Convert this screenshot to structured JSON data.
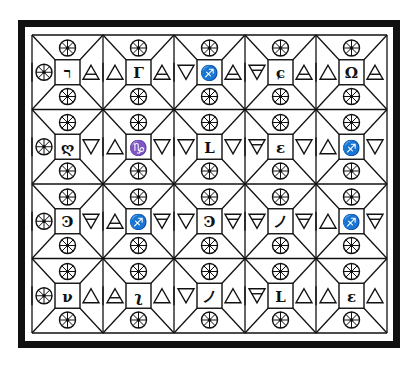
{
  "diagram": {
    "title": "",
    "colors": {
      "ink": "#111111",
      "paper": "#ffffff"
    },
    "frame": {
      "outer": {
        "x": 21.5,
        "y": 23.5,
        "w": 375,
        "h": 321
      }
    },
    "grid": {
      "x0": 32,
      "y0": 35,
      "cell_w": 71,
      "cell_h": 74.5,
      "cols": 5,
      "rows": 4,
      "box_w": 25,
      "box_h": 25
    },
    "legend": {
      "wheel": "eight-spoked wheel",
      "up": "fire triangle",
      "up_line": "air triangle",
      "down": "water triangle",
      "down_line": "earth triangle"
    },
    "rows": [
      [
        {
          "left": "wheel",
          "center": "ר",
          "right": "up_line"
        },
        {
          "left": "up",
          "center": "Γ",
          "right": "up_line"
        },
        {
          "left": "down",
          "center": "♐",
          "right": "up_line"
        },
        {
          "left": "down_line",
          "center": "ɕ",
          "right": "up_line"
        },
        {
          "left": "up",
          "center": "Ω",
          "right": "up_line"
        }
      ],
      [
        {
          "left": "wheel",
          "center": "ღ",
          "right": "down"
        },
        {
          "left": "up",
          "center": "♑",
          "right": "down"
        },
        {
          "left": "down",
          "center": "L",
          "right": "down"
        },
        {
          "left": "down_line",
          "center": "ε",
          "right": "down"
        },
        {
          "left": "up",
          "center": "♐",
          "right": "down"
        }
      ],
      [
        {
          "left": "wheel",
          "center": "Ͽ",
          "right": "down_line"
        },
        {
          "left": "up_line",
          "center": "♐",
          "right": "down_line"
        },
        {
          "left": "down",
          "center": "Ͽ",
          "right": "down_line"
        },
        {
          "left": "down_line",
          "center": "ノ",
          "right": "down_line"
        },
        {
          "left": "up",
          "center": "♐",
          "right": "down_line"
        }
      ],
      [
        {
          "left": "wheel",
          "center": "ν",
          "right": "up"
        },
        {
          "left": "up_line",
          "center": "ʅ",
          "right": "up"
        },
        {
          "left": "down",
          "center": "ノ",
          "right": "up"
        },
        {
          "left": "down_line",
          "center": "L",
          "right": "up"
        },
        {
          "left": "up",
          "center": "ε",
          "right": "up"
        }
      ]
    ]
  }
}
